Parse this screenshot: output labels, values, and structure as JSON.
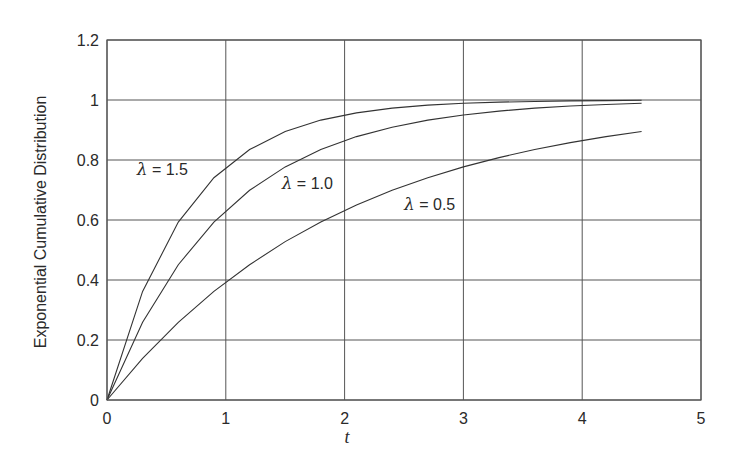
{
  "chart_data": {
    "type": "line",
    "title": "",
    "xlabel": "t",
    "ylabel": "Exponential Cumulative Distribution",
    "xlim": [
      0,
      5
    ],
    "ylim": [
      0,
      1.2
    ],
    "xticks": [
      "0",
      "1",
      "2",
      "3",
      "4",
      "5"
    ],
    "yticks": [
      "0",
      "0.2",
      "0.4",
      "0.6",
      "0.8",
      "1",
      "1.2"
    ],
    "grid": true,
    "legend": "inline annotations",
    "x": [
      0,
      0.3,
      0.6,
      0.9,
      1.2,
      1.5,
      1.8,
      2.1,
      2.4,
      2.7,
      3.0,
      3.3,
      3.6,
      3.9,
      4.2,
      4.5
    ],
    "series": [
      {
        "name": "λ = 1.5",
        "label": "λ = 1.5",
        "label_pos": [
          0.25,
          0.75
        ],
        "values": [
          0,
          0.362,
          0.593,
          0.741,
          0.835,
          0.895,
          0.933,
          0.957,
          0.973,
          0.983,
          0.989,
          0.993,
          0.995,
          0.997,
          0.998,
          0.999
        ]
      },
      {
        "name": "λ = 1.0",
        "label": "λ = 1.0",
        "label_pos": [
          1.47,
          0.705
        ],
        "values": [
          0,
          0.259,
          0.451,
          0.593,
          0.699,
          0.777,
          0.835,
          0.878,
          0.909,
          0.933,
          0.95,
          0.963,
          0.973,
          0.98,
          0.985,
          0.989
        ]
      },
      {
        "name": "λ = 0.5",
        "label": "λ = 0.5",
        "label_pos": [
          2.5,
          0.635
        ],
        "values": [
          0,
          0.139,
          0.259,
          0.362,
          0.451,
          0.528,
          0.593,
          0.65,
          0.699,
          0.741,
          0.777,
          0.808,
          0.835,
          0.858,
          0.878,
          0.895
        ]
      }
    ]
  }
}
